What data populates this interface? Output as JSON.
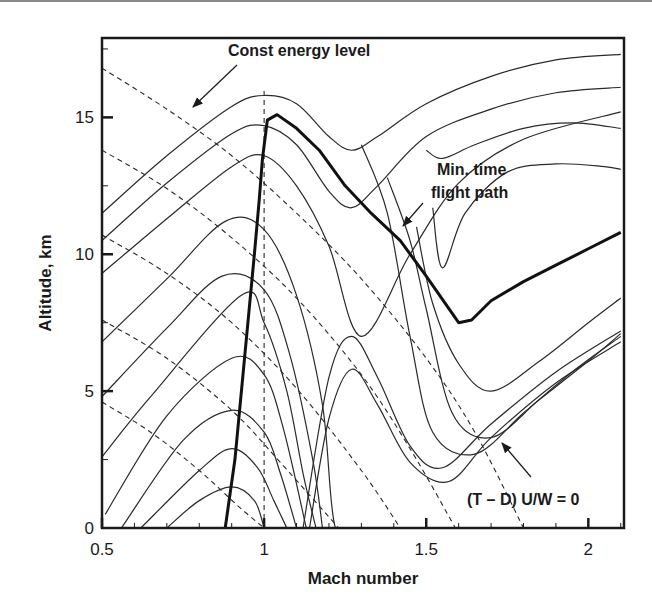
{
  "chart_data": {
    "type": "line",
    "title": "",
    "xlabel": "Mach number",
    "ylabel": "Altitude, km",
    "xlim": [
      0.5,
      2.11
    ],
    "ylim": [
      0,
      18
    ],
    "x_ticks": [
      0.5,
      1,
      1.5,
      2
    ],
    "x_tick_labels": [
      "0.5",
      "1",
      "1.5",
      "2"
    ],
    "y_ticks": [
      0,
      5,
      10,
      15
    ],
    "y_tick_labels": [
      "0",
      "5",
      "10",
      "15"
    ],
    "grid": false,
    "legend": null,
    "annotations": [
      {
        "text": "Const energy level",
        "points_to": [
          0.75,
          15.5
        ]
      },
      {
        "text": "Min. time",
        "line2": "flight path",
        "points_to": [
          1.41,
          10.7
        ]
      },
      {
        "text": "(T – D) U/W = 0",
        "points_to": [
          1.68,
          3.3
        ]
      }
    ],
    "series": [
      {
        "name": "Min. time flight path",
        "style": "thick-solid",
        "x": [
          0.88,
          0.91,
          0.93,
          0.95,
          0.97,
          0.985,
          0.995,
          1.01,
          1.04,
          1.1,
          1.17,
          1.25,
          1.33,
          1.42,
          1.5,
          1.6,
          1.64,
          1.7,
          1.8,
          1.9,
          2.0,
          2.1
        ],
        "y": [
          0,
          2.5,
          5,
          7.5,
          10,
          12,
          13.5,
          14.9,
          15.1,
          14.6,
          13.8,
          12.5,
          11.5,
          10.5,
          9.2,
          7.5,
          7.6,
          8.3,
          9.0,
          9.6,
          10.2,
          10.8
        ]
      },
      {
        "name": "Mach 1 reference",
        "style": "dashed-vertical",
        "x": [
          1.0,
          1.0
        ],
        "y": [
          0,
          16
        ]
      },
      {
        "name": "Constant energy levels",
        "style": "dashed",
        "curves": [
          {
            "y_intercept_at_M0_5": 16.8,
            "x": [
              0.5,
              0.7,
              0.9,
              1.1,
              1.3,
              1.5,
              1.65,
              1.8
            ],
            "y": [
              16.8,
              15.3,
              13.6,
              11.5,
              9.1,
              6.2,
              3.5,
              0
            ]
          },
          {
            "y_intercept_at_M0_5": 13.8,
            "x": [
              0.5,
              0.7,
              0.9,
              1.1,
              1.3,
              1.45,
              1.59
            ],
            "y": [
              13.8,
              12.4,
              10.6,
              8.4,
              5.6,
              2.9,
              0
            ]
          },
          {
            "y_intercept_at_M0_5": 10.7,
            "x": [
              0.5,
              0.7,
              0.9,
              1.1,
              1.3,
              1.42
            ],
            "y": [
              10.7,
              9.3,
              7.5,
              5.1,
              2.1,
              0
            ]
          },
          {
            "y_intercept_at_M0_5": 7.6,
            "x": [
              0.5,
              0.7,
              0.9,
              1.05,
              1.23
            ],
            "y": [
              7.6,
              6.2,
              4.3,
              2.4,
              0
            ]
          },
          {
            "y_intercept_at_M0_5": 4.6,
            "x": [
              0.5,
              0.65,
              0.8,
              0.92,
              1.0
            ],
            "y": [
              4.6,
              3.5,
              2.1,
              0.8,
              0
            ]
          }
        ]
      },
      {
        "name": "Specific excess power contours",
        "style": "thin-solid",
        "unit_note": "(T - D) U/W contours; outermost lower-right = 0",
        "curves": [
          {
            "x": [
              0.5,
              0.7,
              0.9,
              1.0,
              1.1,
              1.2,
              1.27,
              1.35,
              1.5,
              1.7,
              1.9,
              2.1
            ],
            "y": [
              11.5,
              13.6,
              15.4,
              15.8,
              15.5,
              14.3,
              13.8,
              14.3,
              15.5,
              16.5,
              17.1,
              17.3
            ]
          },
          {
            "x": [
              0.5,
              0.7,
              0.9,
              1.0,
              1.1,
              1.2,
              1.27,
              1.35,
              1.5,
              1.7,
              1.9,
              2.1
            ],
            "y": [
              10.5,
              12.6,
              14.4,
              14.7,
              14.0,
              12.3,
              11.7,
              12.5,
              14.3,
              15.3,
              15.9,
              16.1
            ]
          },
          {
            "x": [
              0.5,
              0.7,
              0.9,
              1.0,
              1.1,
              1.2,
              1.3,
              1.45,
              1.6,
              1.8,
              2.1
            ],
            "y": [
              9.3,
              11.3,
              13.2,
              13.6,
              12.5,
              10.3,
              7.0,
              10.0,
              12.6,
              14.2,
              15.2
            ]
          },
          {
            "x": [
              0.5,
              0.7,
              0.88,
              1.0,
              1.1,
              1.18,
              1.22,
              1.3
            ],
            "y": [
              6.8,
              9.1,
              11.2,
              10.9,
              8.5,
              4.5,
              0,
              0
            ]
          },
          {
            "x": [
              0.5,
              0.7,
              0.87,
              1.0,
              1.08,
              1.15,
              1.18
            ],
            "y": [
              4.8,
              7.3,
              9.2,
              8.7,
              6.3,
              2.5,
              0
            ]
          },
          {
            "x": [
              0.5,
              0.65,
              0.93,
              1.0,
              1.07,
              1.12,
              1.16
            ],
            "y": [
              2.6,
              4.8,
              8.5,
              7.5,
              5.0,
              2.0,
              0
            ]
          },
          {
            "x": [
              0.51,
              0.7,
              0.9,
              1.0,
              1.06,
              1.13
            ],
            "y": [
              0.5,
              4.1,
              6.2,
              5.6,
              3.6,
              0
            ]
          },
          {
            "x": [
              0.56,
              0.75,
              0.9,
              1.0,
              1.05,
              1.1
            ],
            "y": [
              0,
              3.2,
              4.3,
              3.5,
              2.0,
              0
            ]
          },
          {
            "x": [
              0.62,
              0.8,
              0.9,
              0.98,
              1.03,
              1.07
            ],
            "y": [
              0,
              2.1,
              2.9,
              2.2,
              1.0,
              0
            ]
          },
          {
            "x": [
              0.7,
              0.8,
              0.9,
              0.97,
              1.0
            ],
            "y": [
              0,
              1.0,
              1.5,
              1.0,
              0
            ]
          },
          {
            "x": [
              1.12,
              1.2,
              1.27,
              1.35,
              1.45,
              1.55,
              1.7,
              1.9,
              2.1
            ],
            "y": [
              0,
              5.5,
              7.0,
              5.5,
              3.0,
              2.2,
              3.8,
              5.7,
              7.2
            ]
          },
          {
            "x": [
              1.14,
              1.2,
              1.27,
              1.35,
              1.45,
              1.57,
              1.7,
              1.9,
              2.1
            ],
            "y": [
              0,
              4.0,
              5.8,
              4.5,
              2.4,
              1.7,
              3.3,
              5.3,
              6.8
            ]
          },
          {
            "x": [
              1.3,
              1.38,
              1.45,
              1.52,
              1.65,
              1.8,
              1.95,
              2.1
            ],
            "y": [
              14.0,
              11.5,
              7.0,
              3.5,
              2.7,
              4.2,
              5.7,
              7.0
            ]
          },
          {
            "x": [
              1.38,
              1.45,
              1.5,
              1.58,
              1.7,
              1.85,
              2.0,
              2.1
            ],
            "y": [
              12.8,
              10.5,
              8.0,
              4.2,
              3.3,
              4.7,
              6.1,
              7.1
            ]
          },
          {
            "x": [
              1.47,
              1.52,
              1.6,
              1.7,
              1.85,
              2.0,
              2.1
            ],
            "y": [
              11.0,
              8.2,
              6.0,
              5.0,
              6.1,
              7.5,
              8.4
            ]
          },
          {
            "x": [
              1.52,
              1.55,
              1.62,
              1.75,
              1.9,
              2.05,
              2.1
            ],
            "y": [
              11.7,
              9.5,
              11.5,
              13.0,
              13.3,
              13.2,
              13.1
            ]
          },
          {
            "x": [
              1.5,
              1.55,
              1.65,
              1.8,
              1.95,
              2.1
            ],
            "y": [
              13.8,
              13.5,
              14.0,
              14.6,
              14.8,
              14.6
            ]
          }
        ]
      }
    ]
  },
  "plot": {
    "frame": {
      "left": 102,
      "right": 624,
      "top": 38,
      "bottom": 528
    },
    "x_range": [
      0.5,
      2.11
    ],
    "y_range": [
      0,
      17.9
    ]
  },
  "labels": {
    "xlabel": "Mach number",
    "ylabel": "Altitude, km",
    "annot_energy": "Const energy level",
    "annot_path_1": "Min. time",
    "annot_path_2": "flight path",
    "annot_zero": "(T – D) U/W = 0"
  }
}
